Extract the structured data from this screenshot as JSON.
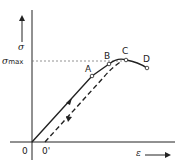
{
  "diagram": {
    "title": "",
    "axes": {
      "y_label": "σ",
      "x_label": "ε",
      "y_ref_label_main": "σ",
      "y_ref_label_sub": "max"
    },
    "origins": {
      "origin": "0",
      "shifted_origin": "0'"
    },
    "points": {
      "A": "A",
      "B": "B",
      "C": "C",
      "D": "D"
    },
    "colors": {
      "ink": "#222222",
      "guide": "#777777"
    }
  }
}
